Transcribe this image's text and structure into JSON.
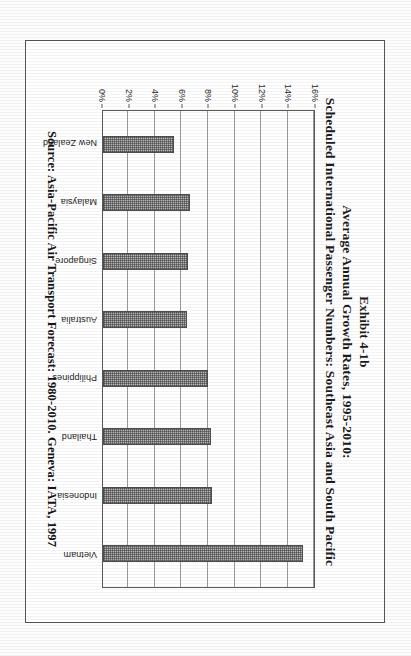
{
  "figure": {
    "title_lines": [
      "Exhibit 4-1b",
      "Average Annual Growth Rates, 1995-2010:",
      "Scheduled International Passenger Numbers: Southeast Asia and South Pacific"
    ],
    "source_note": "Source: Asia-Pacific Air Transport Forecast: 1980-2010. Geneva: IATA, 1997"
  },
  "chart_data": {
    "type": "bar",
    "xlabel": "",
    "ylabel": "",
    "categories": [
      "New Zealand",
      "Malaysia",
      "Singapore",
      "Australia",
      "Philippines",
      "Thailand",
      "Indonesia",
      "Vietnam"
    ],
    "values": [
      5.3,
      6.5,
      6.4,
      6.3,
      7.9,
      8.1,
      8.2,
      15.0
    ],
    "value_unit": "%",
    "ylim": [
      0,
      16
    ],
    "yticks": [
      0,
      2,
      4,
      6,
      8,
      10,
      12,
      14,
      16
    ],
    "ytick_labels": [
      "0%",
      "2%",
      "4%",
      "6%",
      "8%",
      "10%",
      "12%",
      "14%",
      "16%"
    ],
    "grid": true,
    "grid_axis": "y",
    "legend": false,
    "orientation_on_page": "rotated-90-clockwise",
    "bar_fill": "#b9b9b9",
    "bar_edge": "#4e4e4e",
    "series": [
      {
        "name": "Average annual growth rate 1995-2010",
        "values": [
          5.3,
          6.5,
          6.4,
          6.3,
          7.9,
          8.1,
          8.2,
          15.0
        ]
      }
    ]
  }
}
